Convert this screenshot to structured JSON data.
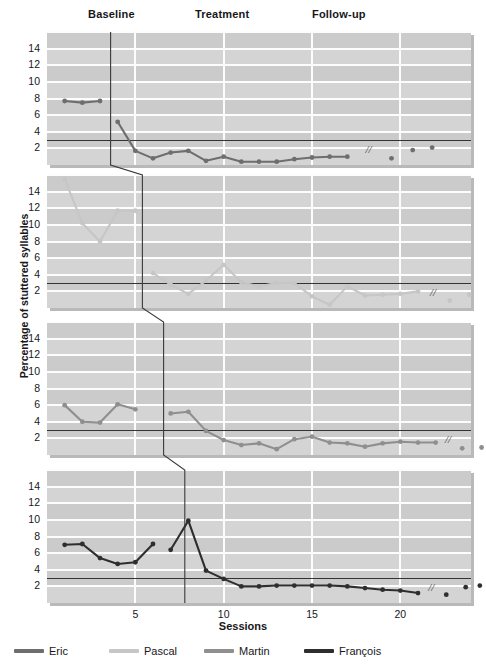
{
  "figure": {
    "ylabel": "Percentage of stuttered syllables",
    "xlabel": "Sessions",
    "phases": [
      {
        "name": "Baseline",
        "x": 88
      },
      {
        "name": "Treatment",
        "x": 195
      },
      {
        "name": "Follow-up",
        "x": 312
      }
    ],
    "break_marker": "//"
  },
  "legend": {
    "items": [
      {
        "label": "Eric",
        "color": "#6e6e6e"
      },
      {
        "label": "Pascal",
        "color": "#c6c6c6"
      },
      {
        "label": "Martin",
        "color": "#8f8f8f"
      },
      {
        "label": "François",
        "color": "#2e2e2e"
      }
    ]
  },
  "chart_data": {
    "type": "line",
    "title": "",
    "xlabel": "Sessions",
    "ylabel": "Percentage of stuttered syllables",
    "xlim": [
      0,
      24
    ],
    "ylim": [
      0,
      16
    ],
    "yticks": [
      2,
      4,
      6,
      8,
      10,
      12,
      14
    ],
    "xticks": [
      5,
      10,
      15,
      20
    ],
    "grid": true,
    "legend_position": "bottom",
    "criterion_line": 3,
    "annotations": [
      "Baseline",
      "Treatment",
      "Follow-up",
      "// (time break before follow-up)"
    ],
    "panels": [
      {
        "name": "Eric",
        "color": "#6e6e6e",
        "baseline_end_session": 3.6,
        "baseline": {
          "x": [
            1,
            2,
            3
          ],
          "y": [
            7.7,
            7.5,
            7.7
          ]
        },
        "treatment": {
          "x": [
            4,
            5,
            6,
            7,
            8,
            9,
            10,
            11,
            12,
            13,
            14,
            15,
            16,
            17
          ],
          "y": [
            5.2,
            1.7,
            0.8,
            1.5,
            1.7,
            0.5,
            1.0,
            0.4,
            0.4,
            0.4,
            0.7,
            0.9,
            1.0,
            1.0
          ]
        },
        "follow_up": {
          "x": [
            19.5,
            20.7,
            21.8
          ],
          "y": [
            0.8,
            1.8,
            2.1
          ]
        }
      },
      {
        "name": "Pascal",
        "color": "#c6c6c6",
        "baseline_end_session": 5.4,
        "baseline": {
          "x": [
            1,
            2,
            3,
            4,
            5
          ],
          "y": [
            15.5,
            10.2,
            8.0,
            11.7,
            11.7
          ]
        },
        "treatment": {
          "x": [
            6,
            7,
            8,
            9,
            10,
            11,
            12,
            13,
            14,
            15,
            16,
            17,
            18,
            19,
            20,
            21
          ],
          "y": [
            4.2,
            2.8,
            1.7,
            3.3,
            5.2,
            3.1,
            2.6,
            3.0,
            3.0,
            1.4,
            0.4,
            2.6,
            1.5,
            1.6,
            1.7,
            2.0
          ]
        },
        "follow_up": {
          "x": [
            22.8,
            23.9,
            25.0
          ],
          "y": [
            0.9,
            1.6,
            1.4
          ]
        }
      },
      {
        "name": "Martin",
        "color": "#8f8f8f",
        "baseline_end_session": 6.6,
        "baseline": {
          "x": [
            1,
            2,
            3,
            4,
            5
          ],
          "y": [
            6.0,
            4.0,
            3.9,
            6.1,
            5.5
          ]
        },
        "treatment": {
          "x": [
            7,
            8,
            9,
            10,
            11,
            12,
            13,
            14,
            15,
            16,
            17,
            18,
            19,
            20,
            21,
            22
          ],
          "y": [
            5.0,
            5.2,
            2.9,
            1.8,
            1.2,
            1.4,
            0.7,
            1.9,
            2.2,
            1.5,
            1.4,
            1.0,
            1.4,
            1.6,
            1.5,
            1.5
          ]
        },
        "follow_up": {
          "x": [
            23.5,
            24.6,
            25.7
          ],
          "y": [
            0.8,
            0.9,
            1.7
          ]
        }
      },
      {
        "name": "François",
        "color": "#2e2e2e",
        "baseline_end_session": 7.8,
        "baseline": {
          "x": [
            1,
            2,
            3,
            4,
            5,
            6
          ],
          "y": [
            7.0,
            7.1,
            5.4,
            4.7,
            4.9,
            7.1
          ]
        },
        "treatment": {
          "x": [
            7,
            8,
            9,
            10,
            11,
            12,
            13,
            14,
            15,
            16,
            17,
            18,
            19,
            20,
            21
          ],
          "y": [
            6.4,
            9.9,
            3.9,
            2.9,
            2.0,
            2.0,
            2.1,
            2.1,
            2.1,
            2.1,
            2.0,
            1.8,
            1.6,
            1.5,
            1.2
          ]
        },
        "follow_up": {
          "x": [
            22.6,
            23.7,
            24.5
          ],
          "y": [
            1.0,
            1.9,
            2.1
          ]
        }
      }
    ]
  }
}
